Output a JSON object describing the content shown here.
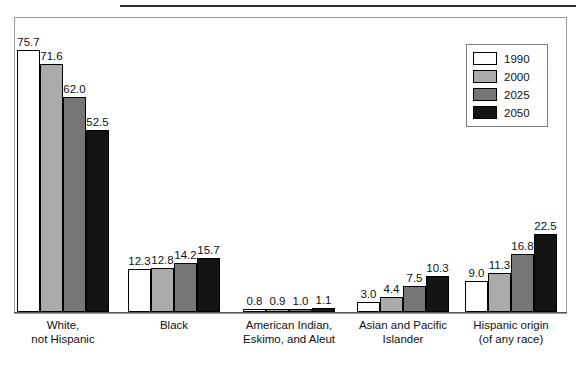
{
  "figure": {
    "top_rule": "horizontal-rule",
    "frame": "plot-border"
  },
  "legend": {
    "position": "top-right-inside-plot",
    "entries": [
      {
        "label": "1990",
        "color": "#ffffff"
      },
      {
        "label": "2000",
        "color": "#ababab"
      },
      {
        "label": "2025",
        "color": "#767676"
      },
      {
        "label": "2050",
        "color": "#141414"
      }
    ]
  },
  "chart_data": {
    "type": "bar",
    "title": "",
    "subtitle": "",
    "xlabel": "",
    "ylabel": "",
    "ylim": [
      0,
      80
    ],
    "grid": false,
    "legend_position": "top right",
    "categories": [
      "White,\nnot Hispanic",
      "Black",
      "American Indian,\nEskimo, and Aleut",
      "Asian and Pacific\nIslander",
      "Hispanic origin\n(of any race)"
    ],
    "series": [
      {
        "name": "1990",
        "color": "#ffffff",
        "values": [
          75.7,
          12.3,
          0.8,
          3.0,
          9.0
        ]
      },
      {
        "name": "2000",
        "color": "#ababab",
        "values": [
          71.6,
          12.8,
          0.9,
          4.4,
          11.3
        ]
      },
      {
        "name": "2025",
        "color": "#767676",
        "values": [
          62.0,
          14.2,
          1.0,
          7.5,
          16.8
        ]
      },
      {
        "name": "2050",
        "color": "#141414",
        "values": [
          52.5,
          15.7,
          1.1,
          10.3,
          22.5
        ]
      }
    ],
    "data_labels": {
      "White, not Hispanic": [
        "75.7",
        "71.6",
        "62.0",
        "52.5"
      ],
      "Black": [
        "12.3",
        "12.8",
        "14.2",
        "15.7"
      ],
      "American Indian, Eskimo, and Aleut": [
        "0.8",
        "0.9",
        "1.0",
        "1.1"
      ],
      "Asian and Pacific Islander": [
        "3.0",
        "4.4",
        "7.5",
        "10.3"
      ],
      "Hispanic origin (of any race)": [
        "9.0",
        "11.3",
        "16.8",
        "22.5"
      ]
    }
  }
}
